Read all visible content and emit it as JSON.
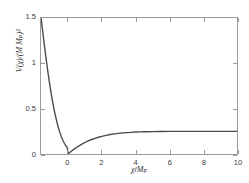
{
  "figure": {
    "background_color": "#ffffff",
    "axis_color": "#9a9a9a",
    "curve_color": "#4a4a4a",
    "text_color": "#2e2e2e"
  },
  "axes": {
    "xlabel_prefix": "",
    "xlabel_var": "χ",
    "xlabel_slash": "/",
    "xlabel_unit": "M",
    "xlabel_unit_sub": "P",
    "ylabel_open": "V(",
    "ylabel_var": "χ",
    "ylabel_mid": ")/(M M",
    "ylabel_sub": "P",
    "ylabel_close": ")",
    "ylabel_exp": "2",
    "xticklabels": [
      "0",
      "2",
      "4",
      "6",
      "8",
      "10"
    ],
    "yticklabels": [
      "0",
      "0.5",
      "1",
      "1.5"
    ]
  },
  "chart_data": {
    "type": "line",
    "title": "",
    "xlabel": "χ/M_P",
    "ylabel": "V(χ)/(M M_P)²",
    "xlim": [
      -1.6,
      10
    ],
    "ylim": [
      0,
      1.5
    ],
    "xticks": [
      0,
      2,
      4,
      6,
      8,
      10
    ],
    "yticks": [
      0,
      0.5,
      1,
      1.5
    ],
    "grid": false,
    "legend": null,
    "series": [
      {
        "name": "V(χ)",
        "color": "#4a4a4a",
        "linewidth": 1.4,
        "x": [
          -1.6,
          -1.55,
          -1.5,
          -1.45,
          -1.4,
          -1.35,
          -1.3,
          -1.25,
          -1.2,
          -1.15,
          -1.1,
          -1.05,
          -1.0,
          -0.95,
          -0.9,
          -0.85,
          -0.8,
          -0.75,
          -0.7,
          -0.65,
          -0.6,
          -0.55,
          -0.5,
          -0.45,
          -0.4,
          -0.35,
          -0.3,
          -0.25,
          -0.2,
          -0.15,
          -0.1,
          -0.05,
          0.0,
          0.05,
          0.1,
          0.15,
          0.2,
          0.3,
          0.4,
          0.5,
          0.6,
          0.7,
          0.8,
          0.9,
          1.0,
          1.2,
          1.4,
          1.6,
          1.8,
          2.0,
          2.25,
          2.5,
          2.75,
          3.0,
          3.25,
          3.5,
          3.75,
          4.0,
          4.25,
          4.5,
          4.75,
          5.0,
          5.5,
          6.0,
          6.5,
          7.0,
          7.5,
          8.0,
          8.5,
          9.0,
          9.5,
          10.0
        ],
        "y": [
          1.5,
          1.43,
          1.352,
          1.276,
          1.2,
          1.126,
          1.054,
          0.984,
          0.916,
          0.851,
          0.788,
          0.728,
          0.67,
          0.616,
          0.564,
          0.515,
          0.468,
          0.425,
          0.384,
          0.346,
          0.31,
          0.277,
          0.247,
          0.219,
          0.193,
          0.17,
          0.149,
          0.13,
          0.113,
          0.098,
          0.084,
          0.073,
          0.0,
          0.008,
          0.016,
          0.023,
          0.031,
          0.046,
          0.059,
          0.072,
          0.084,
          0.096,
          0.107,
          0.117,
          0.127,
          0.144,
          0.16,
          0.173,
          0.185,
          0.195,
          0.206,
          0.215,
          0.222,
          0.228,
          0.233,
          0.236,
          0.239,
          0.242,
          0.244,
          0.245,
          0.246,
          0.247,
          0.248,
          0.249,
          0.249,
          0.25,
          0.25,
          0.25,
          0.25,
          0.25,
          0.25,
          0.25
        ],
        "asymptote": 0.25,
        "minimum": {
          "x": 0.0,
          "y": 0.0
        }
      }
    ]
  }
}
